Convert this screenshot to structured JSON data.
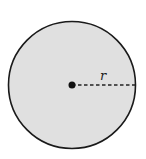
{
  "diagram": {
    "shape": "circle",
    "fill_color": "#e0e0e0",
    "stroke_color": "#1a1a1a",
    "center_point": {
      "x": 72,
      "y": 85
    },
    "radius_px": 64,
    "radius_label": "r",
    "radius_line_style": "dashed"
  }
}
